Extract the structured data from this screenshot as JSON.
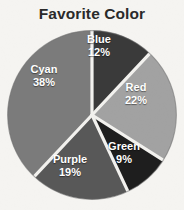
{
  "chart_data": {
    "type": "pie",
    "title": "Favorite Color",
    "xlabel": "",
    "ylabel": "",
    "grid": false,
    "legend": "none",
    "labels_inside_slices": true,
    "start_angle_deg": 0,
    "direction": "clockwise",
    "total_pct": 100,
    "categories": [
      "Blue",
      "Red",
      "Green",
      "Purple",
      "Cyan"
    ],
    "values": [
      12,
      22,
      9,
      19,
      38
    ],
    "value_suffix": "%",
    "slices": [
      {
        "name": "Blue",
        "pct": 12,
        "pct_text": "12%",
        "fill": "#3a3a3a",
        "start_deg": 0.0,
        "end_deg": 43.2
      },
      {
        "name": "Red",
        "pct": 22,
        "pct_text": "22%",
        "fill": "#a2a2a2",
        "start_deg": 43.2,
        "end_deg": 122.4
      },
      {
        "name": "Green",
        "pct": 9,
        "pct_text": "9%",
        "fill": "#1e1e1e",
        "start_deg": 122.4,
        "end_deg": 154.8
      },
      {
        "name": "Purple",
        "pct": 19,
        "pct_text": "19%",
        "fill": "#585858",
        "start_deg": 154.8,
        "end_deg": 223.2
      },
      {
        "name": "Cyan",
        "pct": 38,
        "pct_text": "38%",
        "fill": "#7b7b7b",
        "start_deg": 223.2,
        "end_deg": 360.0
      }
    ],
    "colors": {
      "background": "#f5f4f1",
      "title_text": "#2a2a2a",
      "label_text": "#ffffff",
      "slice_divider": "#f2f1ee",
      "pie_outline": "#6f6f6f"
    }
  }
}
